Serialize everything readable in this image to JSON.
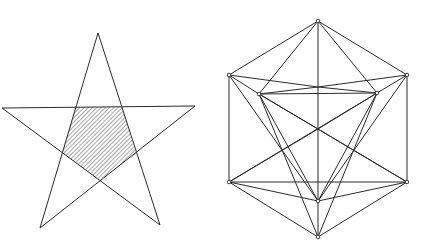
{
  "figures": {
    "pentagram": {
      "stroke": "#2a2a2a",
      "hatch_color": "#3a3a3a",
      "outer_vertices": [
        [
          98,
          33
        ],
        [
          2,
          108
        ],
        [
          195,
          106
        ],
        [
          40,
          228
        ],
        [
          160,
          225
        ]
      ],
      "inner_pentagon": [
        [
          75,
          107
        ],
        [
          122,
          107
        ],
        [
          136,
          154
        ],
        [
          100,
          180
        ],
        [
          62,
          153
        ]
      ],
      "star_path_order": [
        0,
        3,
        2,
        1,
        4
      ]
    },
    "stellated_solid": {
      "stroke": "#2a2a2a",
      "vertex_marker_color": "#2a2a2a",
      "vertices": {
        "top": [
          318,
          21
        ],
        "upper_left": [
          229,
          75
        ],
        "upper_right": [
          407,
          75
        ],
        "inner_left": [
          259,
          94
        ],
        "inner_right": [
          377,
          93
        ],
        "center": [
          318,
          129
        ],
        "lower_left": [
          229,
          182
        ],
        "lower_right": [
          407,
          182
        ],
        "inner_bottom": [
          318,
          201
        ],
        "bottom": [
          318,
          237
        ],
        "mid_cross": [
          318,
          87
        ]
      }
    }
  }
}
